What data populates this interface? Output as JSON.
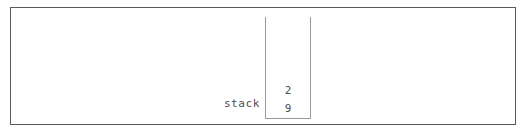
{
  "canvas": {
    "background_color": "#ffffff",
    "border_color": "#5a5a5a"
  },
  "stack_diagram": {
    "label": "stack",
    "label_color": "#4d4d4d",
    "container": {
      "border_color": "#9a9a9a",
      "fill_color": "#ffffff",
      "open_top": true,
      "capacity_hint": 6
    },
    "items_top_to_bottom": [
      "2",
      "9"
    ],
    "items_bottom_to_top": [
      "9",
      "2"
    ],
    "item_count": 2,
    "top_of_stack": "2",
    "bottom_of_stack": "9"
  }
}
